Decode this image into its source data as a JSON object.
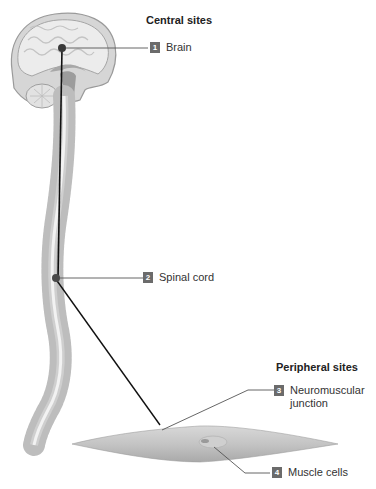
{
  "sections": {
    "central": "Central sites",
    "peripheral": "Peripheral sites"
  },
  "labels": [
    {
      "num": "1",
      "text": "Brain"
    },
    {
      "num": "2",
      "text": "Spinal cord"
    },
    {
      "num": "3",
      "text": "Neuromuscular\njunction"
    },
    {
      "num": "4",
      "text": "Muscle cells"
    }
  ],
  "colors": {
    "label_box": "#6b6b6b",
    "leader_line": "#555555",
    "nerve_line": "#111111",
    "anatomy_gray": "#bdbdbd"
  }
}
